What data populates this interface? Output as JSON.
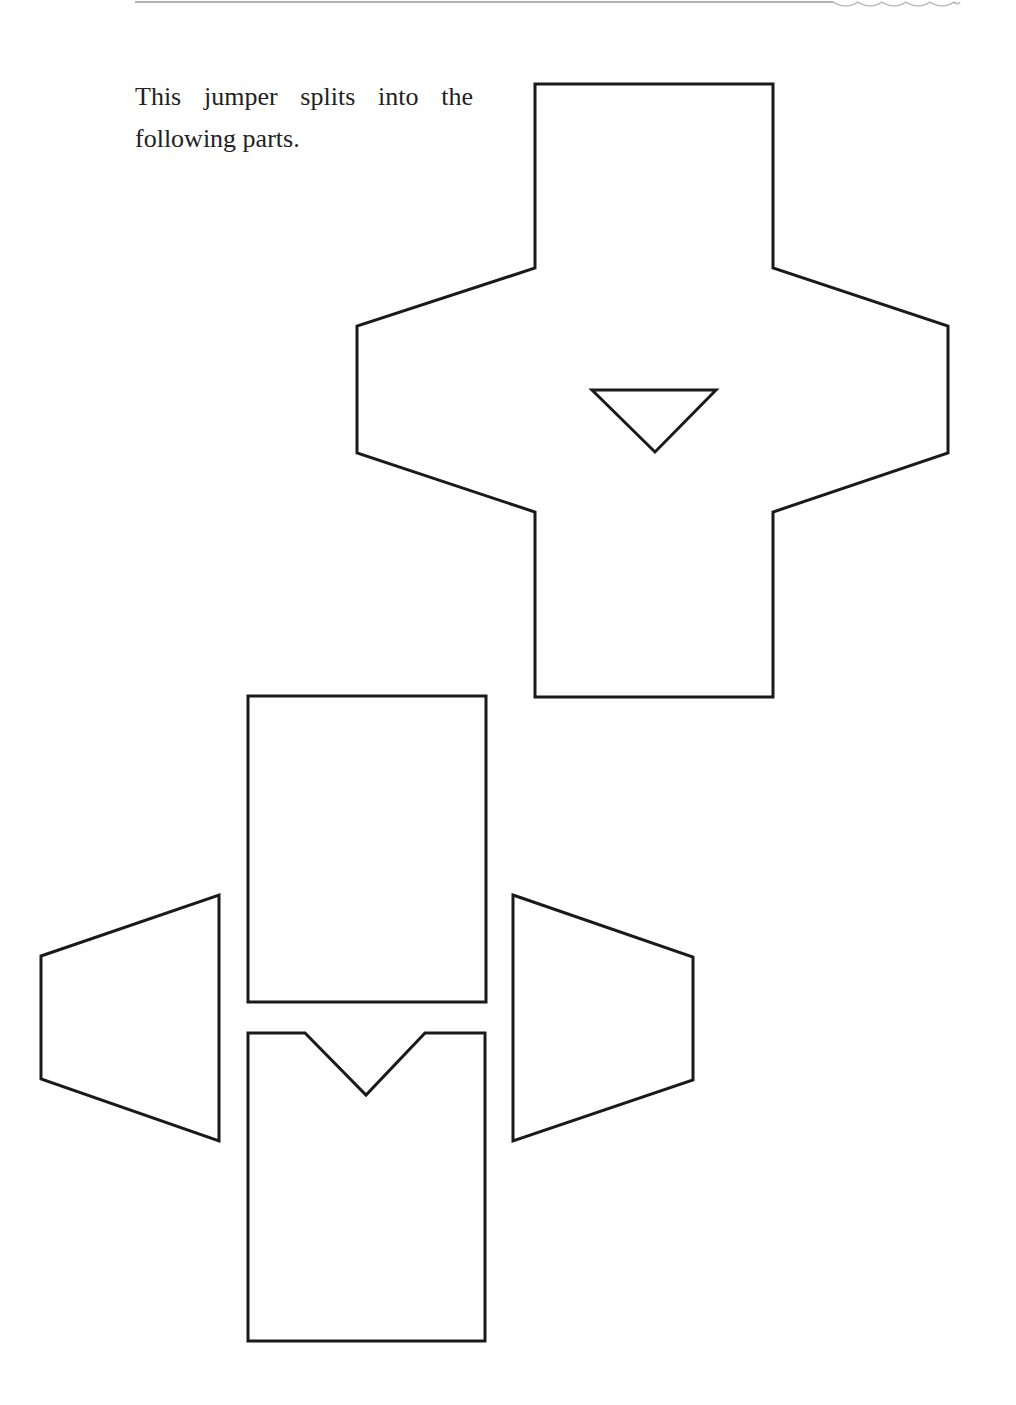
{
  "page": {
    "intro_text": "This jumper splits into the following parts."
  },
  "diagram": {
    "subject": "jumper",
    "whole_garment": {
      "label": "assembled jumper (cross-shaped net)",
      "neck_shape": "inverted triangle"
    },
    "parts": [
      {
        "id": "back",
        "shape": "rectangle"
      },
      {
        "id": "front",
        "shape": "rectangle with V-neck notch"
      },
      {
        "id": "left-sleeve",
        "shape": "trapezoid"
      },
      {
        "id": "right-sleeve",
        "shape": "trapezoid"
      }
    ],
    "colors": {
      "stroke": "#1a1a1a",
      "fill": "#ffffff",
      "text": "#222222"
    }
  }
}
